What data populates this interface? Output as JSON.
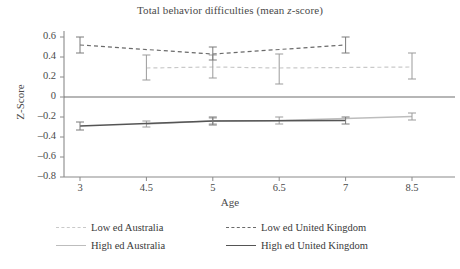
{
  "chart_data": {
    "type": "line",
    "title": "Total behavior difficulties (mean z-score)",
    "title_plain": "Total behavior difficulties (mean ",
    "title_italic": "z",
    "title_tail": "-score)",
    "xlabel": "Age",
    "ylabel": "Z-Score",
    "grid": false,
    "legend_position": "bottom",
    "x": [
      3,
      4.5,
      5,
      6.5,
      7,
      8.5
    ],
    "xtick_labels": [
      "3",
      "4.5",
      "5",
      "6.5",
      "7",
      "8.5"
    ],
    "ylim": [
      -0.8,
      0.6
    ],
    "ytick_labels": [
      "0.6",
      "0.4",
      "0.2",
      "0",
      "–0.2",
      "–0.4",
      "–0.6",
      "–0.8"
    ],
    "ytick_values": [
      0.6,
      0.4,
      0.2,
      0,
      -0.2,
      -0.4,
      -0.6,
      -0.8
    ],
    "zero_line": 0,
    "series": [
      {
        "name": "Low ed Australia",
        "style": "dashed",
        "color": "#c9c9c9",
        "x": [
          4.5,
          5,
          6.5,
          8.5
        ],
        "values": [
          0.29,
          0.3,
          0.29,
          0.3
        ],
        "err_low": [
          0.17,
          0.19,
          0.13,
          0.18
        ],
        "err_high": [
          0.42,
          0.42,
          0.43,
          0.44
        ]
      },
      {
        "name": "Low ed United Kingdom",
        "style": "dashed",
        "color": "#6a6a6a",
        "x": [
          3,
          5,
          7
        ],
        "values": [
          0.52,
          0.43,
          0.52
        ],
        "err_low": [
          0.44,
          0.37,
          0.44
        ],
        "err_high": [
          0.6,
          0.5,
          0.6
        ]
      },
      {
        "name": "High ed Australia",
        "style": "solid",
        "color": "#bdbdbd",
        "x": [
          4.5,
          5,
          6.5,
          8.5
        ],
        "values": [
          -0.27,
          -0.24,
          -0.235,
          -0.195
        ],
        "err_low": [
          -0.3,
          -0.27,
          -0.27,
          -0.23
        ],
        "err_high": [
          -0.24,
          -0.21,
          -0.2,
          -0.16
        ]
      },
      {
        "name": "High ed United Kingdom",
        "style": "solid",
        "color": "#555555",
        "x": [
          3,
          5,
          7
        ],
        "values": [
          -0.29,
          -0.24,
          -0.235
        ],
        "err_low": [
          -0.33,
          -0.28,
          -0.27
        ],
        "err_high": [
          -0.25,
          -0.2,
          -0.2
        ]
      }
    ]
  },
  "legend": {
    "items": [
      {
        "label": "Low ed Australia",
        "swatch": "sw-dash-light"
      },
      {
        "label": "Low ed United Kingdom",
        "swatch": "sw-dash-dark"
      },
      {
        "label": "High ed Australia",
        "swatch": "sw-solid-light"
      },
      {
        "label": "High ed United Kingdom",
        "swatch": "sw-solid-dark"
      }
    ]
  }
}
